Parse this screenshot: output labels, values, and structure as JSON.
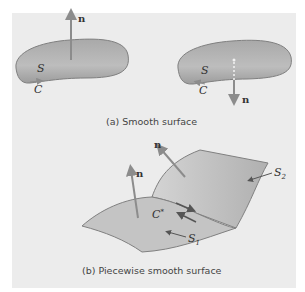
{
  "figure": {
    "panel_a": {
      "caption": "(a)  Smooth surface",
      "left_surface": {
        "surface_label": "S",
        "curve_label": "C",
        "normal_label": "n",
        "normal_direction": "up"
      },
      "right_surface": {
        "surface_label": "S",
        "curve_label": "C",
        "normal_label": "n",
        "normal_direction": "down"
      }
    },
    "panel_b": {
      "caption": "(b)  Piecewise smooth surface",
      "surface1_label": "S",
      "surface1_sub": "1",
      "surface2_label": "S",
      "surface2_sub": "2",
      "shared_curve_label": "C*",
      "normal1_label": "n",
      "normal2_label": "n"
    },
    "colors": {
      "surface_fill": "#b3b3b3",
      "surface_edge": "#7a7a7a",
      "arrow": "#8c8c8c",
      "background": "#ececec"
    }
  }
}
